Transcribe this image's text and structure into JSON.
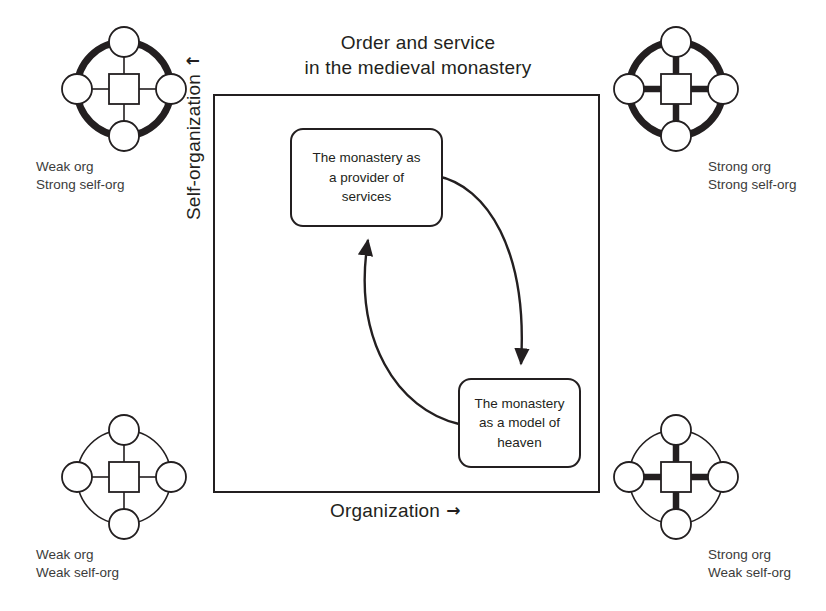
{
  "figure": {
    "title_line1": "Order and service",
    "title_line2": "in the medieval monastery"
  },
  "axes": {
    "y_label": "Self-organization",
    "y_arrow": "↑",
    "x_label": "Organization",
    "x_arrow": "→"
  },
  "boxes": [
    {
      "id": "box-services",
      "line1": "The monastery as",
      "line2": "a provider of",
      "line3": "services"
    },
    {
      "id": "box-heaven",
      "line1": "The monastery",
      "line2": "as a model of",
      "line3": "heaven"
    }
  ],
  "corners": [
    {
      "id": "corner-tl",
      "position": "top-left",
      "icon": "ring-hub-spokes-icon",
      "ring": "thick",
      "spokes": "thin",
      "caption_line1": "Weak org",
      "caption_line2": "Strong self-org"
    },
    {
      "id": "corner-tr",
      "position": "top-right",
      "icon": "ring-hub-spokes-icon",
      "ring": "thick",
      "spokes": "thick",
      "caption_line1": "Strong org",
      "caption_line2": "Strong self-org"
    },
    {
      "id": "corner-bl",
      "position": "bottom-left",
      "icon": "ring-hub-spokes-icon",
      "ring": "thin",
      "spokes": "thin",
      "caption_line1": "Weak org",
      "caption_line2": "Weak self-org"
    },
    {
      "id": "corner-br",
      "position": "bottom-right",
      "icon": "ring-hub-spokes-icon",
      "ring": "thin",
      "spokes": "thick",
      "caption_line1": "Strong org",
      "caption_line2": "Weak self-org"
    }
  ],
  "arrows": [
    {
      "id": "arrow-services-to-heaven",
      "from": "box-services",
      "to": "box-heaven",
      "shape": "curved"
    },
    {
      "id": "arrow-heaven-to-services",
      "from": "box-heaven",
      "to": "box-services",
      "shape": "curved"
    }
  ],
  "colors": {
    "ink": "#231f20",
    "caption": "#3b3b3b",
    "background": "#ffffff"
  }
}
